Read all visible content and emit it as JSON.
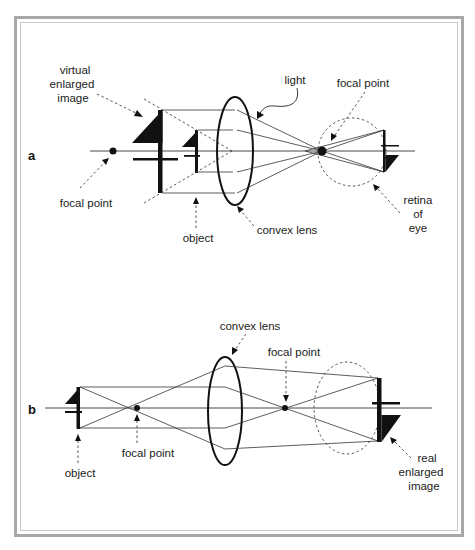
{
  "figure": {
    "panel_a": {
      "label": "a",
      "annotations": {
        "virtual_image": [
          "virtual",
          "enlarged",
          "image"
        ],
        "light": "light",
        "focal_point_right": "focal point",
        "focal_point_left": "focal point",
        "object": "object",
        "convex_lens": "convex lens",
        "retina": [
          "retina",
          "of",
          "eye"
        ]
      }
    },
    "panel_b": {
      "label": "b",
      "annotations": {
        "convex_lens": "convex lens",
        "focal_point_right": "focal point",
        "focal_point_left": "focal point",
        "object": "object",
        "real_image": [
          "real",
          "enlarged",
          "image"
        ]
      }
    },
    "colors": {
      "frame_outer": "#a8a8a8",
      "frame_inner": "#c8c8c8",
      "ink": "#111111",
      "background": "#ffffff"
    }
  }
}
